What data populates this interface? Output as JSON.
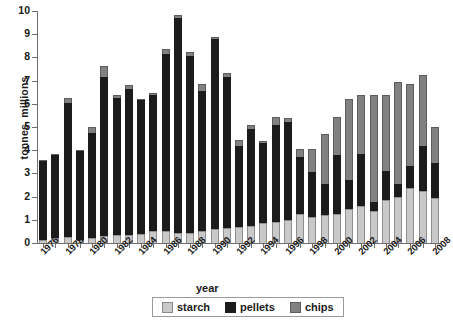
{
  "chart_data": {
    "type": "bar",
    "stacked": true,
    "title": "",
    "xlabel": "year",
    "ylabel": "tonnes, millions",
    "ylim": [
      0,
      10
    ],
    "ytick_values": [
      0,
      1,
      2,
      3,
      4,
      5,
      6,
      7,
      8,
      9,
      10
    ],
    "ytick_labels": [
      "0",
      "1",
      "2",
      "3",
      "4",
      "5",
      "6",
      "7",
      "8",
      "9",
      "10"
    ],
    "grid": false,
    "legend_position": "bottom",
    "legend_entries": [
      "starch",
      "pellets",
      "chips"
    ],
    "series_colors": {
      "starch": "#c9c9c9",
      "pellets": "#1b1b1b",
      "chips": "#818181"
    },
    "categories": [
      "1976",
      "1977",
      "1978",
      "1979",
      "1980",
      "1981",
      "1982",
      "1983",
      "1984",
      "1985",
      "1986",
      "1987",
      "1988",
      "1989",
      "1990",
      "1991",
      "1992",
      "1993",
      "1994",
      "1995",
      "1996",
      "1997",
      "1998",
      "1999",
      "2000",
      "2001",
      "2002",
      "2003",
      "2004",
      "2005",
      "2006",
      "2007",
      "2008"
    ],
    "tick_label_interval": 2,
    "tick_labels_shown": [
      "1976",
      "1978",
      "1980",
      "1982",
      "1984",
      "1986",
      "1988",
      "1990",
      "1992",
      "1994",
      "1996",
      "1998",
      "2000",
      "2002",
      "2004",
      "2006",
      "2008"
    ],
    "series": [
      {
        "name": "starch",
        "values": [
          0.15,
          0.2,
          0.25,
          0.15,
          0.2,
          0.3,
          0.35,
          0.35,
          0.4,
          0.5,
          0.5,
          0.45,
          0.45,
          0.5,
          0.6,
          0.65,
          0.7,
          0.75,
          0.85,
          0.9,
          1.0,
          1.25,
          1.1,
          1.2,
          1.25,
          1.45,
          1.6,
          1.4,
          1.85,
          2.0,
          2.35,
          2.25,
          1.95
        ]
      },
      {
        "name": "pellets",
        "values": [
          3.4,
          3.6,
          5.8,
          3.8,
          4.55,
          6.85,
          5.9,
          6.3,
          5.75,
          5.9,
          7.65,
          9.25,
          7.6,
          6.05,
          8.2,
          6.5,
          3.5,
          4.15,
          3.45,
          4.2,
          4.2,
          2.45,
          1.95,
          1.35,
          2.55,
          1.25,
          2.25,
          0.35,
          1.25,
          0.55,
          0.95,
          1.95,
          1.5
        ]
      },
      {
        "name": "chips",
        "values": [
          0.05,
          0.05,
          0.2,
          0.05,
          0.25,
          0.5,
          0.15,
          0.15,
          0.05,
          0.05,
          0.2,
          0.15,
          0.2,
          0.3,
          0.1,
          0.2,
          0.25,
          0.2,
          0.1,
          0.35,
          0.2,
          0.35,
          1.0,
          2.15,
          1.65,
          3.5,
          2.55,
          4.65,
          3.3,
          4.4,
          3.55,
          3.05,
          1.55
        ]
      }
    ],
    "totals": [
      3.6,
      3.85,
      6.25,
      4.0,
      5.0,
      7.65,
      6.4,
      6.8,
      6.2,
      6.45,
      8.35,
      9.85,
      8.25,
      6.85,
      8.9,
      7.35,
      4.45,
      5.1,
      4.4,
      5.45,
      5.4,
      4.05,
      4.05,
      4.7,
      5.45,
      6.2,
      6.4,
      6.4,
      6.4,
      6.95,
      6.85,
      7.25,
      5.0
    ]
  }
}
